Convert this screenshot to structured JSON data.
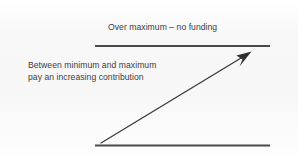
{
  "diagram": {
    "type": "funding-band-diagram",
    "background_color": "#f7f7f7",
    "line_color": "#4a4a4a",
    "text_color": "#3d3d3d",
    "labels": {
      "over_maximum": "Over maximum – no funding",
      "between_line_1": "Between minimum and maximum",
      "between_line_2": "pay an increasing contribution"
    },
    "rules": {
      "maximum_rule_name": "maximum-threshold-line",
      "minimum_rule_name": "minimum-threshold-line"
    },
    "arrow": {
      "name": "increasing-contribution-arrow",
      "direction": "up-right"
    }
  }
}
